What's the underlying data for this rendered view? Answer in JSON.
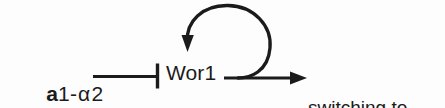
{
  "diagram": {
    "type": "regulatory-pathway",
    "background_color": "#fdfdfd",
    "stroke_color": "#1b1b1b",
    "nodes": {
      "repressor": {
        "prefix": "a",
        "middle": "1-",
        "greek": "α",
        "suffix": "2",
        "full_text": "a1-α2"
      },
      "regulator": {
        "label": "Wor1"
      },
      "output": {
        "line1": "switching to",
        "line2": "Opaque state"
      }
    },
    "edges": {
      "inhibition": {
        "kind": "inhibition",
        "head": "t-bar",
        "from": "a1-α2",
        "to": "Wor1"
      },
      "self_activation": {
        "kind": "activation",
        "head": "arrow",
        "from": "Wor1",
        "to": "Wor1"
      },
      "activation": {
        "kind": "activation",
        "head": "arrow",
        "from": "Wor1",
        "to": "switching to Opaque state"
      }
    }
  }
}
